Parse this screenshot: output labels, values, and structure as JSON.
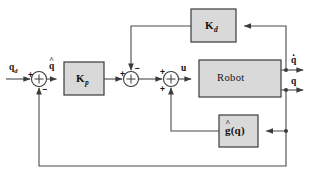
{
  "diagram": {
    "colors": {
      "block_fill": "#d9d9d9",
      "block_stroke": "#3a3a3a",
      "wire": "#4a4a4a",
      "background": "#ffffff",
      "text": "#111111"
    },
    "blocks": [
      {
        "id": "kd",
        "label": "K",
        "subscript": "d",
        "name": "derivative-gain-block"
      },
      {
        "id": "kp",
        "label": "K",
        "subscript": "p",
        "name": "proportional-gain-block"
      },
      {
        "id": "robot",
        "label": "Robot",
        "subscript": "",
        "name": "robot-plant-block"
      },
      {
        "id": "ghat",
        "label": "g",
        "subscript": "",
        "suffix": "(q)",
        "accent": "hat",
        "name": "gravity-compensation-block"
      }
    ],
    "summers": [
      {
        "id": "sum1",
        "name": "error-summing-junction",
        "signs": {
          "left": "+",
          "bottom": "−"
        }
      },
      {
        "id": "sum2",
        "name": "damping-summing-junction",
        "signs": {
          "left": "+",
          "top": "−"
        }
      },
      {
        "id": "sum3",
        "name": "control-summing-junction",
        "signs": {
          "left": "+",
          "bottom": "+"
        }
      }
    ],
    "signals": {
      "reference": {
        "base": "q",
        "subscript": "d",
        "accent": "none",
        "name": "reference-input-label"
      },
      "error": {
        "base": "q",
        "subscript": "",
        "accent": "hat",
        "name": "position-error-label"
      },
      "control": {
        "base": "u",
        "subscript": "",
        "accent": "none",
        "name": "control-input-label"
      },
      "velocity_out": {
        "base": "q",
        "subscript": "",
        "accent": "dot",
        "name": "joint-velocity-output-label"
      },
      "position_out": {
        "base": "q",
        "subscript": "",
        "accent": "none",
        "name": "joint-position-output-label"
      }
    }
  }
}
